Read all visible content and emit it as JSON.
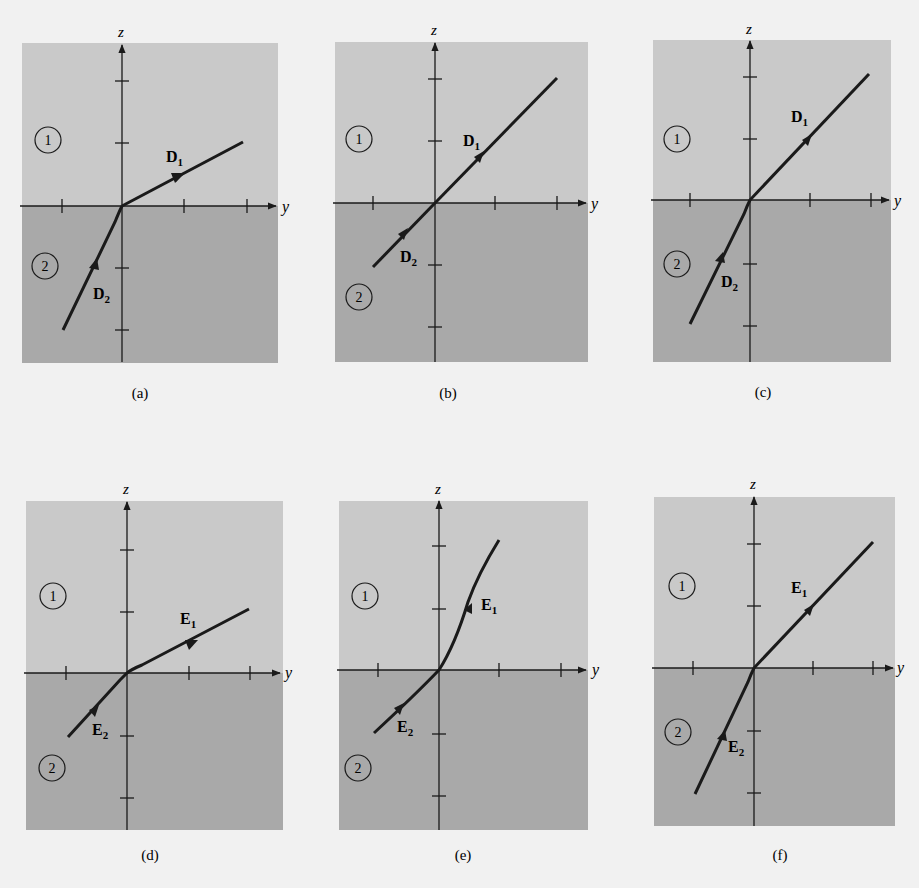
{
  "figure": {
    "axis_labels": {
      "horizontal": "y",
      "vertical": "z"
    },
    "region_labels": {
      "top": "1",
      "bottom": "2"
    },
    "colors": {
      "page_background": "#f1f1f1",
      "region_1_fill": "#c9c9c9",
      "region_2_fill": "#a9a9a9",
      "line": "#1a1a1a"
    },
    "panels": [
      {
        "id": "a",
        "caption": "(a)",
        "field": "D",
        "upper_vector": {
          "symbol": "D",
          "subscript": "1"
        },
        "lower_vector": {
          "symbol": "D",
          "subscript": "2"
        },
        "description": "D1 shallow slope in region 1; D2 steep slope in region 2"
      },
      {
        "id": "b",
        "caption": "(b)",
        "field": "D",
        "upper_vector": {
          "symbol": "D",
          "subscript": "1"
        },
        "lower_vector": {
          "symbol": "D",
          "subscript": "2"
        },
        "description": "D1 and D2 collinear at 45 degrees"
      },
      {
        "id": "c",
        "caption": "(c)",
        "field": "D",
        "upper_vector": {
          "symbol": "D",
          "subscript": "1"
        },
        "lower_vector": {
          "symbol": "D",
          "subscript": "2"
        },
        "description": "D1 at about 45 degrees; D2 steeper in region 2"
      },
      {
        "id": "d",
        "caption": "(d)",
        "field": "E",
        "upper_vector": {
          "symbol": "E",
          "subscript": "1"
        },
        "lower_vector": {
          "symbol": "E",
          "subscript": "2"
        },
        "description": "E1 shallow slope; E2 at about 45 degrees"
      },
      {
        "id": "e",
        "caption": "(e)",
        "field": "E",
        "upper_vector": {
          "symbol": "E",
          "subscript": "1"
        },
        "lower_vector": {
          "symbol": "E",
          "subscript": "2"
        },
        "description": "E1 steep curved in region 1; E2 shallow in region 2"
      },
      {
        "id": "f",
        "caption": "(f)",
        "field": "E",
        "upper_vector": {
          "symbol": "E",
          "subscript": "1"
        },
        "lower_vector": {
          "symbol": "E",
          "subscript": "2"
        },
        "description": "E1 at about 45 degrees; E2 steeper in region 2"
      }
    ]
  }
}
